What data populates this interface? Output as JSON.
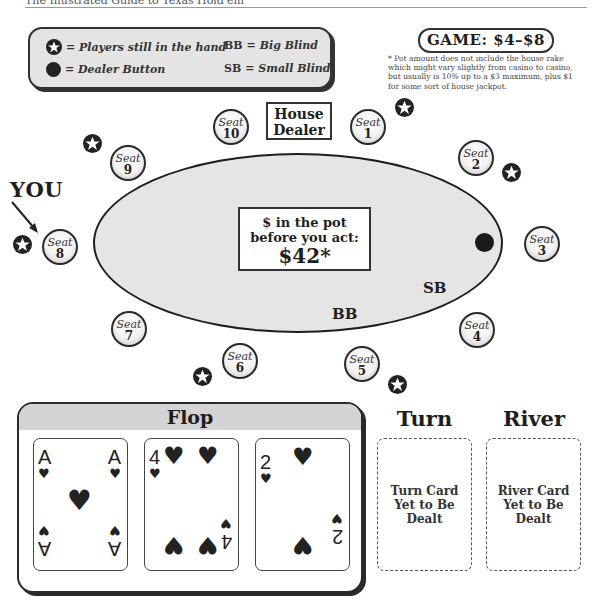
{
  "page_header": {
    "text": "The Illustrated Guide to Texas Hold'em"
  },
  "legend": {
    "items": [
      {
        "icon": "star-icon",
        "label": "= Players still in the hand"
      },
      {
        "icon": "dealer-button-icon",
        "label": "= Dealer Button"
      },
      {
        "abbr": "BB",
        "label": "= Big Blind"
      },
      {
        "abbr": "SB",
        "label": "= Small Blind"
      }
    ]
  },
  "game": {
    "label": "GAME: $4–$8"
  },
  "footnote": "* Pot amount does not include the house rake which might vary slightly from casino to casino, but usually is 10% up to a $3 maximum, plus $1 for some sort of house jackpot.",
  "table": {
    "house_dealer": "House Dealer",
    "pot_label_line1": "$ in the pot",
    "pot_label_line2": "before you act:",
    "pot_amount": "$42*",
    "sb_label": "SB",
    "bb_label": "BB",
    "you_label": "YOU",
    "dealer_button_seat": 3,
    "seats": [
      {
        "word": "Seat",
        "num": "1",
        "in_hand": true
      },
      {
        "word": "Seat",
        "num": "2",
        "in_hand": true
      },
      {
        "word": "Seat",
        "num": "3",
        "in_hand": false
      },
      {
        "word": "Seat",
        "num": "4",
        "in_hand": false
      },
      {
        "word": "Seat",
        "num": "5",
        "in_hand": true
      },
      {
        "word": "Seat",
        "num": "6",
        "in_hand": true
      },
      {
        "word": "Seat",
        "num": "7",
        "in_hand": false
      },
      {
        "word": "Seat",
        "num": "8",
        "in_hand": true
      },
      {
        "word": "Seat",
        "num": "9",
        "in_hand": true
      },
      {
        "word": "Seat",
        "num": "10",
        "in_hand": false
      }
    ]
  },
  "board": {
    "flop_label": "Flop",
    "flop_cards": [
      {
        "rank": "A",
        "suit": "♥"
      },
      {
        "rank": "4",
        "suit": "♥"
      },
      {
        "rank": "2",
        "suit": "♥"
      }
    ],
    "turn_label": "Turn",
    "turn_placeholder": "Turn Card Yet to Be Dealt",
    "river_label": "River",
    "river_placeholder": "River Card Yet to Be Dealt"
  },
  "colors": {
    "table_felt": "#e5e5e5",
    "outline": "#1d1d1d",
    "flop_header": "#d4d4d4"
  }
}
